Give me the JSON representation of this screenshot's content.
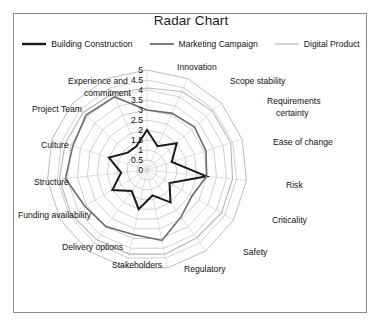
{
  "chart_data": {
    "type": "radar",
    "title": "Radar Chart",
    "categories": [
      "Innovation",
      "Scope stability",
      "Requirements certainty",
      "Ease of change",
      "Risk",
      "Criticality",
      "Safety",
      "Regulatory",
      "Stakeholders",
      "Delivery options",
      "Funding availability",
      "Structure",
      "Culture",
      "Project Team",
      "Experience and commitment"
    ],
    "tick_labels": [
      "5",
      "4.5",
      "4",
      "3.5",
      "3",
      "2.5",
      "2",
      "1.5",
      "1",
      "0.5",
      "0"
    ],
    "rlim": [
      0,
      5
    ],
    "rstep": 0.5,
    "grid": true,
    "legend_position": "top",
    "series": [
      {
        "name": "Building Construction",
        "color": "#1a1a1a",
        "width": 2.0,
        "values": [
          2,
          1.3,
          2,
          1.3,
          3,
          1.3,
          2,
          1.3,
          2,
          1.3,
          2,
          1.3,
          2,
          1.3,
          1.3
        ]
      },
      {
        "name": "Marketing Campaign",
        "color": "#6b6b6b",
        "width": 1.6,
        "values": [
          3,
          3.1,
          3.2,
          3.1,
          3,
          2.6,
          2.9,
          3.6,
          3.3,
          3.5,
          3.6,
          4.1,
          3.9,
          4.1,
          4.0
        ]
      },
      {
        "name": "Digital Product",
        "color": "#b5b5b5",
        "width": 1.1,
        "values": [
          4.1,
          4.3,
          4.4,
          4.4,
          4.3,
          4.3,
          4.2,
          4.3,
          4.3,
          4.3,
          4.4,
          4.4,
          4.3,
          4.3,
          4.2
        ]
      }
    ]
  },
  "legend": {
    "items": [
      {
        "label": "Building Construction"
      },
      {
        "label": "Marketing Campaign"
      },
      {
        "label": "Digital Product"
      }
    ]
  },
  "axis_label_layout": [
    {
      "label": "Innovation",
      "x": 163,
      "y": 10,
      "anchor": "start"
    },
    {
      "label": "Scope stability",
      "x": 216,
      "y": 24,
      "anchor": "start"
    },
    {
      "label": "Requirements",
      "x": 253,
      "y": 44,
      "anchor": "start"
    },
    {
      "label": "certainty",
      "x": 262,
      "y": 56,
      "anchor": "start"
    },
    {
      "label": "Ease of change",
      "x": 259,
      "y": 85,
      "anchor": "start"
    },
    {
      "label": "Risk",
      "x": 272,
      "y": 128,
      "anchor": "start"
    },
    {
      "label": "Criticality",
      "x": 258,
      "y": 163,
      "anchor": "start"
    },
    {
      "label": "Safety",
      "x": 229,
      "y": 195,
      "anchor": "start"
    },
    {
      "label": "Regulatory",
      "x": 170,
      "y": 212,
      "anchor": "start"
    },
    {
      "label": "Stakeholders",
      "x": 98,
      "y": 208,
      "anchor": "start"
    },
    {
      "label": "Delivery options",
      "x": 48,
      "y": 190,
      "anchor": "start"
    },
    {
      "label": "Funding availability",
      "x": 4,
      "y": 158,
      "anchor": "start"
    },
    {
      "label": "Structure",
      "x": 20,
      "y": 125,
      "anchor": "start"
    },
    {
      "label": "Culture",
      "x": 27,
      "y": 88,
      "anchor": "start"
    },
    {
      "label": "Project Team",
      "x": 18,
      "y": 52,
      "anchor": "start"
    },
    {
      "label": "Experience and",
      "x": 54,
      "y": 24,
      "anchor": "start"
    },
    {
      "label": "commitment",
      "x": 70,
      "y": 36,
      "anchor": "start"
    }
  ]
}
